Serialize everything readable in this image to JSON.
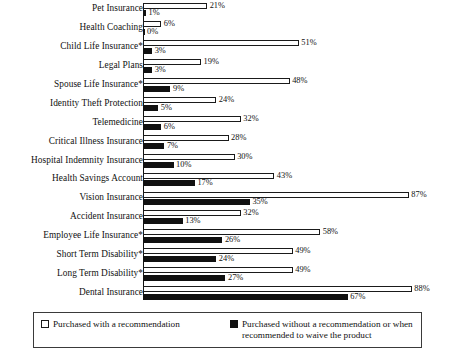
{
  "chart_data": {
    "type": "bar",
    "orientation": "horizontal",
    "title": "",
    "subtitle": "",
    "xlabel": "",
    "ylabel": "",
    "xlim": [
      0,
      90
    ],
    "grid": false,
    "legend_position": "bottom",
    "value_suffix": "%",
    "categories": [
      "Pet Insurance",
      "Health Coaching",
      "Child Life Insurance*",
      "Legal Plans",
      "Spouse Life Insurance*",
      "Identity Theft Protection",
      "Telemedicine",
      "Critical Illness Insurance",
      "Hospital Indemnity Insurance",
      "Health Savings Account",
      "Vision Insurance",
      "Accident Insurance",
      "Employee Life Insurance*",
      "Short Term Disability*",
      "Long Term Disability*",
      "Dental Insurance"
    ],
    "series": [
      {
        "name": "Purchased with a recommendation",
        "color": "#ffffff",
        "border": "#1a1a1a",
        "values": [
          21,
          6,
          51,
          19,
          48,
          24,
          32,
          28,
          30,
          43,
          87,
          32,
          58,
          49,
          49,
          88
        ],
        "labels": [
          "21%",
          "6%",
          "51%",
          "19%",
          "48%",
          "24%",
          "32%",
          "28%",
          "30%",
          "43%",
          "87%",
          "32%",
          "58%",
          "49%",
          "49%",
          "88%"
        ]
      },
      {
        "name": "Purchased without a recommendation or when recommended to waive the product",
        "color": "#111111",
        "border": "#111111",
        "values": [
          1,
          0,
          3,
          3,
          9,
          5,
          6,
          7,
          10,
          17,
          35,
          13,
          26,
          24,
          27,
          67
        ],
        "labels": [
          "1%",
          "0%",
          "3%",
          "3%",
          "9%",
          "5%",
          "6%",
          "7%",
          "10%",
          "17%",
          "35%",
          "13%",
          "26%",
          "24%",
          "27%",
          "67%"
        ]
      }
    ]
  },
  "legend": {
    "entries": [
      {
        "label": "Purchased with a recommendation",
        "swatch": "light"
      },
      {
        "label": "Purchased without a recommendation or when recommended to waive the product",
        "swatch": "dark"
      }
    ]
  },
  "colors": {
    "light_fill": "#ffffff",
    "dark_fill": "#111111",
    "axis": "#111111",
    "text": "#111111",
    "legend_border": "#3a3a3a"
  }
}
